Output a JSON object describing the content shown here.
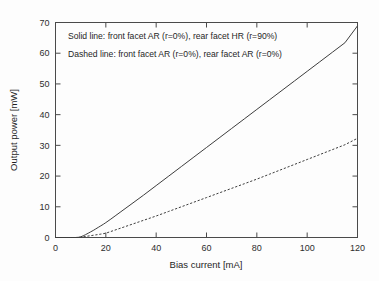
{
  "chart_data": {
    "type": "line",
    "title": "",
    "xlabel": "Bias current [mA]",
    "ylabel": "Output power [mW]",
    "xlim": [
      0,
      120
    ],
    "ylim": [
      0,
      70
    ],
    "xticks": [
      0,
      20,
      40,
      60,
      80,
      100,
      120
    ],
    "yticks": [
      0,
      10,
      20,
      30,
      40,
      50,
      60,
      70
    ],
    "grid": false,
    "legend_position": "top-left-inside",
    "annotations": [
      "Solid line: front facet AR (r=0%), rear facet HR (r=90%)",
      "Dashed line: front facet AR (r=0%), rear facet AR (r=0%)"
    ],
    "series": [
      {
        "name": "Solid line: front facet AR (r=0%), rear facet HR (r=90%)",
        "style": "solid",
        "threshold_mA": 10,
        "x": [
          0,
          2,
          4,
          6,
          8,
          9,
          10,
          11,
          12,
          13,
          14,
          15,
          16,
          17,
          18,
          19,
          20,
          22,
          24,
          26,
          28,
          30,
          35,
          40,
          45,
          50,
          55,
          60,
          65,
          70,
          75,
          80,
          85,
          90,
          95,
          100,
          105,
          110,
          115,
          120
        ],
        "y": [
          0,
          0,
          0,
          0,
          0,
          0.05,
          0.2,
          0.55,
          0.95,
          1.4,
          1.85,
          2.3,
          2.8,
          3.3,
          3.8,
          4.3,
          4.85,
          6.0,
          7.2,
          8.4,
          9.6,
          10.8,
          13.8,
          16.9,
          20.0,
          23.1,
          26.2,
          29.3,
          32.4,
          35.5,
          38.6,
          41.7,
          44.8,
          47.9,
          51.0,
          54.1,
          57.2,
          60.3,
          63.4,
          68.9
        ]
      },
      {
        "name": "Dashed line: front facet AR (r=0%), rear facet AR (r=0%)",
        "style": "dashed",
        "threshold_mA": 10,
        "x": [
          0,
          2,
          4,
          6,
          8,
          9,
          10,
          12,
          14,
          16,
          18,
          20,
          25,
          30,
          35,
          40,
          45,
          50,
          55,
          60,
          65,
          70,
          75,
          80,
          85,
          90,
          95,
          100,
          105,
          110,
          115,
          120
        ],
        "y": [
          0,
          0,
          0,
          0,
          0,
          0.02,
          0.1,
          0.35,
          0.6,
          0.85,
          1.1,
          1.4,
          2.8,
          4.2,
          5.6,
          7.0,
          8.5,
          10.0,
          11.5,
          13.0,
          14.5,
          16.0,
          17.5,
          19.0,
          20.6,
          22.2,
          23.8,
          25.4,
          27.0,
          28.6,
          30.2,
          32.3
        ]
      }
    ]
  },
  "figure": {
    "background_color": "#fdfdfd",
    "line_color": "#3d3d3d",
    "axis_color": "#4a4a4a"
  }
}
